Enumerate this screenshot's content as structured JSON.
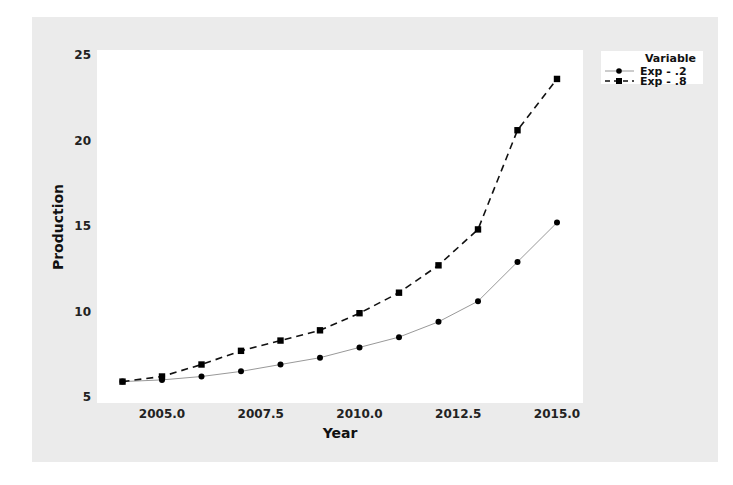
{
  "chart_data": {
    "type": "line",
    "title": "",
    "xlabel": "Year",
    "ylabel": "Production",
    "x": [
      2004,
      2005,
      2006,
      2007,
      2008,
      2009,
      2010,
      2011,
      2012,
      2013,
      2014,
      2015
    ],
    "series": [
      {
        "name": "Exp - .2",
        "marker": "circle",
        "line": "solid",
        "color": "#999999",
        "values": [
          5.9,
          6.0,
          6.2,
          6.5,
          6.9,
          7.3,
          7.9,
          8.5,
          9.4,
          10.6,
          12.9,
          15.2
        ]
      },
      {
        "name": "Exp - .8",
        "marker": "square",
        "line": "dashed",
        "color": "#111111",
        "values": [
          5.9,
          6.2,
          6.9,
          7.7,
          8.3,
          8.9,
          9.9,
          11.1,
          12.7,
          14.8,
          20.6,
          23.6
        ]
      }
    ],
    "xticks": [
      "2005.0",
      "2007.5",
      "2010.0",
      "2012.5",
      "2015.0"
    ],
    "xtick_values": [
      2005,
      2007.5,
      2010,
      2012.5,
      2015
    ],
    "yticks": [
      "5",
      "10",
      "15",
      "20",
      "25"
    ],
    "ytick_values": [
      5,
      10,
      15,
      20,
      25
    ],
    "xlim": [
      2003.1,
      2015.7
    ],
    "ylim": [
      4.65,
      25.3
    ],
    "grid": false,
    "legend": {
      "title": "Variable",
      "position": "right-top",
      "entries": [
        "Exp - .2",
        "Exp - .8"
      ]
    }
  }
}
